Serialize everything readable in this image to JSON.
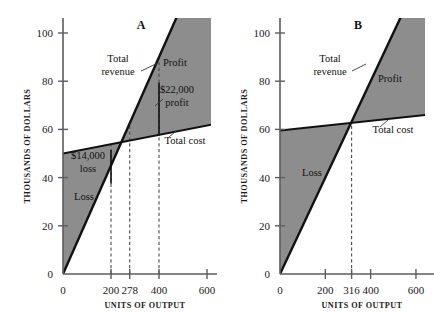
{
  "figure": {
    "background": "#ffffff",
    "shade_color": "#8d8d8d",
    "line_color": "#111111",
    "axis_color": "#5c5c5c"
  },
  "chart_data": [
    {
      "type": "line",
      "panel": "A",
      "title": "A",
      "xlabel": "UNITS OF OUTPUT",
      "ylabel": "THOUSANDS OF DOLLARS",
      "xlim": [
        0,
        640
      ],
      "ylim": [
        0,
        108
      ],
      "xticks": [
        0,
        200,
        278,
        400,
        600
      ],
      "xticklabels": [
        "0",
        "200",
        "278",
        "400",
        "600"
      ],
      "yticks": [
        0,
        20,
        40,
        60,
        80,
        100
      ],
      "yticklabels": [
        "0",
        "20",
        "40",
        "60",
        "80",
        "100"
      ],
      "grid": false,
      "legend": "inline-annotations",
      "series": [
        {
          "name": "Total revenue",
          "x": [
            0,
            640
          ],
          "y": [
            0,
            144
          ],
          "note": "slope 0.225 thousand dollars per unit; passes through origin"
        },
        {
          "name": "Total cost",
          "x": [
            0,
            640
          ],
          "y": [
            50,
            62.4
          ],
          "note": "fixed cost 50 thousand; slope 0.0194 per unit"
        }
      ],
      "breakeven": {
        "units": 278,
        "label": "278"
      },
      "annotations": [
        {
          "name": "total-revenue-label",
          "text": "Total\nrevenue",
          "line1": "Total",
          "line2": "revenue"
        },
        {
          "name": "total-cost-label",
          "text": "Total cost"
        },
        {
          "name": "profit-label",
          "text": "Profit"
        },
        {
          "name": "loss-label",
          "text": "Loss"
        },
        {
          "name": "loss-amount-label",
          "line1": "$14,000",
          "line2": "loss",
          "at_units": 200,
          "value": 14000
        },
        {
          "name": "profit-amount-label",
          "line1": "$22,000",
          "line2": "profit",
          "at_units": 400,
          "value": 22000
        }
      ],
      "markers": [
        {
          "name": "loss-bracket",
          "units": 200,
          "from": 37.5,
          "to": 51.5
        },
        {
          "name": "profit-bracket",
          "units": 400,
          "from": 57.5,
          "to": 79.5
        }
      ],
      "dashed_verticals": [
        200,
        278,
        400
      ]
    },
    {
      "type": "line",
      "panel": "B",
      "title": "B",
      "xlabel": "UNITS OF OUTPUT",
      "ylabel": "THOUSANDS OF DOLLARS",
      "xlim": [
        0,
        640
      ],
      "ylim": [
        0,
        108
      ],
      "xticks": [
        0,
        200,
        316,
        400,
        600
      ],
      "xticklabels": [
        "0",
        "200",
        "316",
        "400",
        "600"
      ],
      "yticks": [
        0,
        20,
        40,
        60,
        80,
        100
      ],
      "yticklabels": [
        "0",
        "20",
        "40",
        "60",
        "80",
        "100"
      ],
      "grid": false,
      "legend": "inline-annotations",
      "series": [
        {
          "name": "Total revenue",
          "x": [
            0,
            640
          ],
          "y": [
            0,
            128
          ],
          "note": "slope 0.2 thousand dollars per unit; passes through origin"
        },
        {
          "name": "Total cost",
          "x": [
            0,
            640
          ],
          "y": [
            59.5,
            66
          ],
          "note": "fixed cost 59.5 thousand; shallow slope"
        }
      ],
      "breakeven": {
        "units": 316,
        "label": "316"
      },
      "annotations": [
        {
          "name": "total-revenue-label",
          "text": "Total\nrevenue",
          "line1": "Total",
          "line2": "revenue"
        },
        {
          "name": "total-cost-label",
          "text": "Total cost"
        },
        {
          "name": "profit-label",
          "text": "Profit"
        },
        {
          "name": "loss-label",
          "text": "Loss"
        }
      ],
      "dashed_verticals": [
        316
      ]
    }
  ]
}
